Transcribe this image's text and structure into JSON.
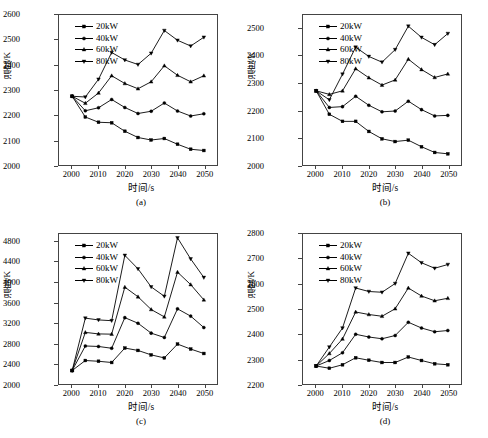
{
  "figure": {
    "panels": [
      "a",
      "b",
      "c",
      "d"
    ],
    "axis_labels": {
      "x": "时间/s",
      "y": "温度/K"
    },
    "series_names": [
      "20kW",
      "40kW",
      "60kW",
      "80kW"
    ],
    "markers": [
      "square-marker",
      "circle-marker",
      "triangle-up-marker",
      "triangle-down-marker"
    ],
    "line_color": "#000000"
  },
  "captions": {
    "a": "(a)",
    "b": "(b)",
    "c": "(c)",
    "d": "(d)"
  },
  "chart_data": [
    {
      "type": "line",
      "panel": "(a)",
      "title": "",
      "xlabel": "时间/s",
      "ylabel": "温度/K",
      "xlim": [
        1995,
        2055
      ],
      "ylim": [
        2000,
        2600
      ],
      "xticks": [
        2000,
        2010,
        2020,
        2030,
        2040,
        2050
      ],
      "yticks": [
        2000,
        2100,
        2200,
        2300,
        2400,
        2500,
        2600
      ],
      "grid": false,
      "legend_position": "upper-left",
      "x": [
        2000,
        2005,
        2010,
        2015,
        2020,
        2025,
        2030,
        2035,
        2040,
        2045,
        2050
      ],
      "series": [
        {
          "name": "20kW",
          "marker": "square-marker",
          "values": [
            2275,
            2192,
            2171,
            2169,
            2135,
            2110,
            2100,
            2106,
            2083,
            2063,
            2058
          ]
        },
        {
          "name": "40kW",
          "marker": "circle-marker",
          "values": [
            2275,
            2217,
            2229,
            2262,
            2230,
            2206,
            2215,
            2248,
            2216,
            2196,
            2205
          ]
        },
        {
          "name": "60kW",
          "marker": "triangle-up-marker",
          "values": [
            2275,
            2247,
            2288,
            2357,
            2326,
            2305,
            2333,
            2397,
            2359,
            2333,
            2357
          ]
        },
        {
          "name": "80kW",
          "marker": "triangle-down-marker",
          "values": [
            2275,
            2272,
            2343,
            2450,
            2420,
            2402,
            2447,
            2538,
            2499,
            2476,
            2511
          ]
        }
      ]
    },
    {
      "type": "line",
      "panel": "(b)",
      "title": "",
      "xlabel": "时间/s",
      "ylabel": "温度/K",
      "xlim": [
        1995,
        2055
      ],
      "ylim": [
        2000,
        2550
      ],
      "xticks": [
        2000,
        2010,
        2020,
        2030,
        2040,
        2050
      ],
      "yticks": [
        2000,
        2100,
        2200,
        2300,
        2400,
        2500
      ],
      "grid": false,
      "legend_position": "upper-left",
      "x": [
        2000,
        2005,
        2010,
        2015,
        2020,
        2025,
        2030,
        2035,
        2040,
        2045,
        2050
      ],
      "series": [
        {
          "name": "20kW",
          "marker": "square-marker",
          "values": [
            2272,
            2186,
            2160,
            2160,
            2123,
            2096,
            2086,
            2091,
            2067,
            2046,
            2041
          ]
        },
        {
          "name": "40kW",
          "marker": "circle-marker",
          "values": [
            2272,
            2211,
            2214,
            2252,
            2219,
            2195,
            2198,
            2234,
            2203,
            2180,
            2182
          ]
        },
        {
          "name": "60kW",
          "marker": "triangle-up-marker",
          "values": [
            2272,
            2259,
            2272,
            2353,
            2320,
            2293,
            2312,
            2388,
            2350,
            2321,
            2334
          ]
        },
        {
          "name": "80kW",
          "marker": "triangle-down-marker",
          "values": [
            2272,
            2239,
            2333,
            2432,
            2398,
            2377,
            2423,
            2509,
            2468,
            2441,
            2482
          ]
        }
      ]
    },
    {
      "type": "line",
      "panel": "(c)",
      "title": "",
      "xlabel": "时间/s",
      "ylabel": "温度/K",
      "xlim": [
        1995,
        2055
      ],
      "ylim": [
        2000,
        4950
      ],
      "xticks": [
        2000,
        2010,
        2020,
        2030,
        2040,
        2050
      ],
      "yticks": [
        2000,
        2400,
        2800,
        3200,
        3600,
        4000,
        4400,
        4800
      ],
      "grid": false,
      "legend_position": "upper-left",
      "x": [
        2000,
        2005,
        2010,
        2015,
        2020,
        2025,
        2030,
        2035,
        2040,
        2045,
        2050
      ],
      "series": [
        {
          "name": "20kW",
          "marker": "square-marker",
          "values": [
            2265,
            2462,
            2447,
            2423,
            2707,
            2660,
            2573,
            2513,
            2785,
            2687,
            2600
          ]
        },
        {
          "name": "40kW",
          "marker": "circle-marker",
          "values": [
            2265,
            2748,
            2738,
            2703,
            3305,
            3195,
            3000,
            2915,
            3478,
            3335,
            3110
          ]
        },
        {
          "name": "60kW",
          "marker": "triangle-up-marker",
          "values": [
            2265,
            3015,
            2985,
            2980,
            3905,
            3715,
            3465,
            3320,
            4200,
            3955,
            3655
          ]
        },
        {
          "name": "80kW",
          "marker": "triangle-down-marker",
          "values": [
            2265,
            3295,
            3260,
            3245,
            4530,
            4265,
            3910,
            3725,
            4875,
            4460,
            4095
          ]
        }
      ]
    },
    {
      "type": "line",
      "panel": "(d)",
      "title": "",
      "xlabel": "时间/s",
      "ylabel": "温度/K",
      "xlim": [
        1995,
        2055
      ],
      "ylim": [
        2200,
        2800
      ],
      "xticks": [
        2000,
        2010,
        2020,
        2030,
        2040,
        2050
      ],
      "yticks": [
        2200,
        2300,
        2400,
        2500,
        2600,
        2700,
        2800
      ],
      "grid": false,
      "legend_position": "upper-left",
      "x": [
        2000,
        2005,
        2010,
        2015,
        2020,
        2025,
        2030,
        2035,
        2040,
        2045,
        2050
      ],
      "series": [
        {
          "name": "20kW",
          "marker": "square-marker",
          "values": [
            2272,
            2263,
            2277,
            2305,
            2295,
            2286,
            2286,
            2308,
            2294,
            2281,
            2277
          ]
        },
        {
          "name": "40kW",
          "marker": "circle-marker",
          "values": [
            2272,
            2294,
            2325,
            2399,
            2388,
            2381,
            2394,
            2447,
            2424,
            2409,
            2414
          ]
        },
        {
          "name": "60kW",
          "marker": "triangle-up-marker",
          "values": [
            2272,
            2322,
            2380,
            2488,
            2478,
            2471,
            2501,
            2584,
            2552,
            2533,
            2543
          ]
        },
        {
          "name": "80kW",
          "marker": "triangle-down-marker",
          "values": [
            2272,
            2348,
            2424,
            2584,
            2570,
            2567,
            2602,
            2723,
            2685,
            2663,
            2678
          ]
        }
      ]
    }
  ]
}
